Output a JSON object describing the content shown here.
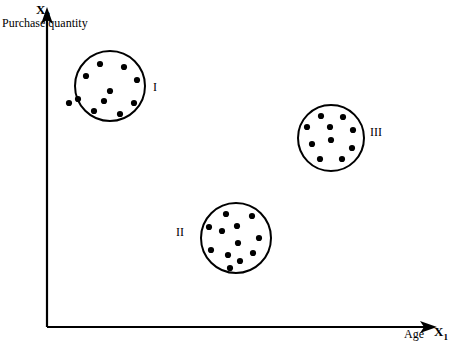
{
  "figure": {
    "background_color": "#ffffff",
    "stroke_color": "#000000",
    "width": 459,
    "height": 345
  },
  "axes": {
    "y": {
      "title": "X",
      "title_subscript": "2",
      "description": "Purchase quantity",
      "origin": [
        47,
        327
      ],
      "tip": [
        47,
        9
      ],
      "has_arrow": true
    },
    "x": {
      "title": "X",
      "title_subscript": "1",
      "description": "Age",
      "origin": [
        47,
        327
      ],
      "tip": [
        437,
        327
      ],
      "has_arrow": true
    }
  },
  "chart_data": {
    "type": "scatter",
    "title": "",
    "xlabel": "Age X1",
    "ylabel": "Purchase quantity X2",
    "grid": false,
    "legend": "none",
    "axis_style": "arrow-axes-no-ticks",
    "xlim": [
      47,
      437
    ],
    "ylim": [
      327,
      9
    ],
    "clusters": [
      {
        "label": "I",
        "label_position": "right",
        "center": [
          110,
          86
        ],
        "radius": 35,
        "point_count": 11,
        "points": [
          [
            100,
            64
          ],
          [
            124,
            67
          ],
          [
            86,
            76
          ],
          [
            137,
            80
          ],
          [
            78,
            99
          ],
          [
            110,
            91
          ],
          [
            134,
            103
          ],
          [
            94,
            111
          ],
          [
            69,
            103
          ],
          [
            120,
            114
          ],
          [
            104,
            101
          ]
        ]
      },
      {
        "label": "II",
        "label_position": "left",
        "center": [
          236,
          238
        ],
        "radius": 35,
        "point_count": 12,
        "points": [
          [
            226,
            214
          ],
          [
            252,
            216
          ],
          [
            237,
            226
          ],
          [
            209,
            227
          ],
          [
            222,
            231
          ],
          [
            259,
            238
          ],
          [
            238,
            243
          ],
          [
            211,
            250
          ],
          [
            228,
            255
          ],
          [
            253,
            253
          ],
          [
            240,
            261
          ],
          [
            230,
            268
          ]
        ]
      },
      {
        "label": "III",
        "label_position": "right",
        "center": [
          331,
          138
        ],
        "radius": 33,
        "point_count": 10,
        "points": [
          [
            321,
            116
          ],
          [
            343,
            117
          ],
          [
            307,
            127
          ],
          [
            330,
            127
          ],
          [
            353,
            130
          ],
          [
            331,
            140
          ],
          [
            312,
            144
          ],
          [
            352,
            148
          ],
          [
            320,
            159
          ],
          [
            342,
            159
          ]
        ]
      }
    ]
  }
}
